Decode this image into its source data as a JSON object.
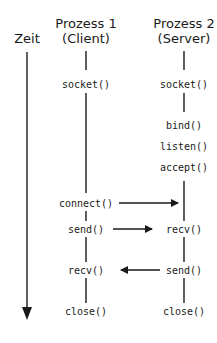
{
  "time_axis": {
    "label": "Zeit"
  },
  "client": {
    "title": "Prozess 1",
    "subtitle": "(Client)",
    "calls": [
      "socket()",
      "connect()",
      "send()",
      "recv()",
      "close()"
    ]
  },
  "server": {
    "title": "Prozess 2",
    "subtitle": "(Server)",
    "calls": [
      "socket()",
      "bind()",
      "listen()",
      "accept()",
      "recv()",
      "send()",
      "close()"
    ]
  },
  "messages": [
    {
      "from": "client.connect()",
      "to": "server.accept()",
      "direction": "right"
    },
    {
      "from": "client.send()",
      "to": "server.recv()",
      "direction": "right"
    },
    {
      "from": "server.send()",
      "to": "client.recv()",
      "direction": "left"
    }
  ],
  "colors": {
    "ink": "#1a1a1a",
    "background": "#ffffff"
  }
}
